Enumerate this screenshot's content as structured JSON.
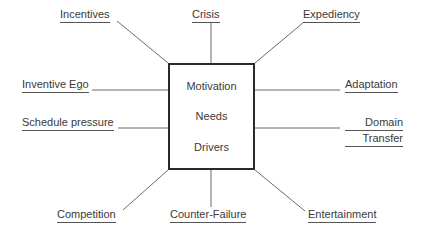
{
  "diagram": {
    "type": "radial-spoke",
    "center": {
      "lines": [
        "Motivation",
        "Needs",
        "Drivers"
      ]
    },
    "colors": {
      "background": "#ffffff",
      "box_border": "#2a2a2a",
      "text": "#3a3a3a",
      "connector_line": "#6b6b6b",
      "underline": "#555555"
    },
    "nodes": [
      {
        "id": "incentives",
        "label": "Incentives",
        "position": "top-left",
        "lines": [
          "Incentives"
        ]
      },
      {
        "id": "crisis",
        "label": "Crisis",
        "position": "top-center",
        "lines": [
          "Crisis"
        ]
      },
      {
        "id": "expediency",
        "label": "Expediency",
        "position": "top-right",
        "lines": [
          "Expediency"
        ]
      },
      {
        "id": "inventive-ego",
        "label": "Inventive Ego",
        "position": "left-upper",
        "lines": [
          "Inventive Ego"
        ]
      },
      {
        "id": "schedule-pressure",
        "label": "Schedule pressure",
        "position": "left-lower",
        "lines": [
          "Schedule pressure"
        ]
      },
      {
        "id": "adaptation",
        "label": "Adaptation",
        "position": "right-upper",
        "lines": [
          "Adaptation"
        ]
      },
      {
        "id": "domain-transfer",
        "label": "Domain Transfer",
        "position": "right-lower",
        "lines": [
          "Domain",
          "Transfer"
        ]
      },
      {
        "id": "competition",
        "label": "Competition",
        "position": "bottom-left",
        "lines": [
          "Competition"
        ]
      },
      {
        "id": "counter-failure",
        "label": "Counter-Failure",
        "position": "bottom-center",
        "lines": [
          "Counter-Failure"
        ]
      },
      {
        "id": "entertainment",
        "label": "Entertainment",
        "position": "bottom-right",
        "lines": [
          "Entertainment"
        ]
      }
    ]
  }
}
